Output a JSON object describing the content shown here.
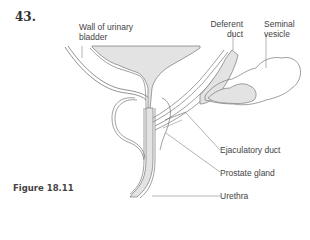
{
  "figure": {
    "number": "43.",
    "caption": "Figure 18.11"
  },
  "labels": {
    "wall_of_urinary_bladder": {
      "line1": "Wall of urinary",
      "line2": "bladder"
    },
    "deferent_duct": {
      "line1": "Deferent",
      "line2": "duct"
    },
    "seminal_vesicle": {
      "line1": "Seminal",
      "line2": "vesicle"
    },
    "ejaculatory_duct": "Ejaculatory duct",
    "prostate_gland": "Prostate gland",
    "urethra": "Urethra"
  },
  "colors": {
    "fill": "#e3e3e3",
    "outline": "#777777",
    "leader": "#666666",
    "text": "#444444"
  }
}
